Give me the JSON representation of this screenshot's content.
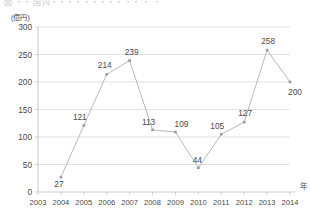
{
  "figure": {
    "title_clipped": "図 ・・ 国内・・・・・・・・・・・ ・ ・",
    "y_unit_label": "(億円)",
    "x_axis_name": "年"
  },
  "chart_data": {
    "type": "line",
    "title": "",
    "xlabel": "年",
    "ylabel": "(億円)",
    "categories": [
      "2003",
      "2004",
      "2005",
      "2006",
      "2007",
      "2008",
      "2009",
      "2010",
      "2011",
      "2012",
      "2013",
      "2014"
    ],
    "values": [
      null,
      27,
      121,
      214,
      239,
      113,
      109,
      44,
      105,
      127,
      258,
      200
    ],
    "point_labels": [
      "",
      "27",
      "121",
      "214",
      "239",
      "113",
      "109",
      "44",
      "105",
      "127",
      "258",
      "200"
    ],
    "yticks": [
      0,
      50,
      100,
      150,
      200,
      250,
      300
    ],
    "ytick_labels": [
      "0",
      "50",
      "100",
      "150",
      "200",
      "250",
      "300"
    ],
    "ylim": [
      0,
      300
    ],
    "grid": true,
    "legend": false,
    "line_color": "#b9b9b9",
    "marker_color": "#9a9a9a",
    "grid_color": "#d4d4d4",
    "text_color": "#4a4a4a"
  }
}
